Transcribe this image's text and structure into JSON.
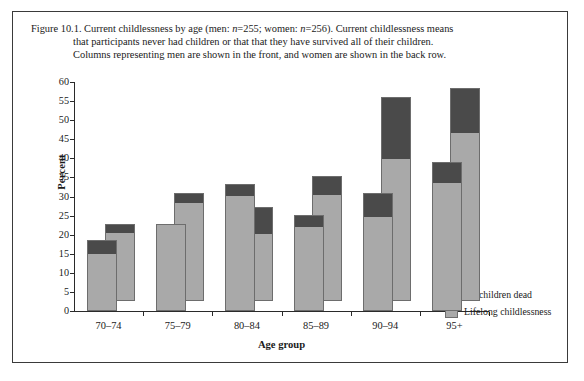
{
  "figure": {
    "caption_lines": [
      "Figure 10.1. Current childlessness by age (men: n=255; women: n=256). Current childlessness means",
      "that participants never had children or that that they have survived all of their children.",
      "Columns representing men are shown in the front, and women are shown in the back row."
    ]
  },
  "colors": {
    "all_children_dead": "#4a4a4a",
    "lifelong_childlessness": "#a9a9a9",
    "axis": "#2a2a2a",
    "bar_outline": "#6d6d6d",
    "frame": "#3a3a3a"
  },
  "legend": {
    "position": "bottom-right",
    "entries": [
      {
        "label": "All children dead",
        "color": "#4a4a4a"
      },
      {
        "label": "Lifelong childlessness",
        "color": "#a9a9a9"
      }
    ]
  },
  "chart_data": {
    "type": "bar",
    "subtype": "stacked-3d-two-row",
    "title": "",
    "xlabel": "Age group",
    "ylabel": "Percent",
    "ylim": [
      0,
      60
    ],
    "yticks": [
      0,
      5,
      10,
      15,
      20,
      25,
      30,
      35,
      40,
      45,
      50,
      55,
      60
    ],
    "ytick_labels": [
      "0",
      "5",
      "10",
      "15",
      "20",
      "25",
      "30",
      "35",
      "40",
      "45",
      "50",
      "55",
      "60"
    ],
    "grid": false,
    "categories": [
      "70–74",
      "75–79",
      "80–84",
      "85–89",
      "90–94",
      "95+"
    ],
    "row_order": [
      "women (back row)",
      "men (front row)"
    ],
    "series": [
      {
        "name": "Lifelong childlessness",
        "group": "men",
        "row": "front",
        "color": "#a9a9a9",
        "values": [
          15.2,
          22.9,
          30.5,
          22.2,
          24.9,
          33.9
        ]
      },
      {
        "name": "All children dead",
        "group": "men",
        "row": "front",
        "color": "#4a4a4a",
        "values": [
          3.3,
          0.0,
          2.8,
          2.9,
          6.0,
          5.2
        ]
      },
      {
        "name": "Lifelong childlessness",
        "group": "women",
        "row": "back",
        "color": "#a9a9a9",
        "values": [
          18.2,
          25.9,
          17.7,
          28.1,
          37.5,
          44.4
        ]
      },
      {
        "name": "All children dead",
        "group": "women",
        "row": "back",
        "color": "#4a4a4a",
        "values": [
          2.1,
          2.4,
          6.8,
          4.7,
          15.9,
          11.5
        ]
      }
    ],
    "totals": {
      "men": [
        18.5,
        22.9,
        33.3,
        25.1,
        30.9,
        39.1
      ],
      "women": [
        20.3,
        28.3,
        24.5,
        32.8,
        53.4,
        55.9
      ]
    }
  }
}
